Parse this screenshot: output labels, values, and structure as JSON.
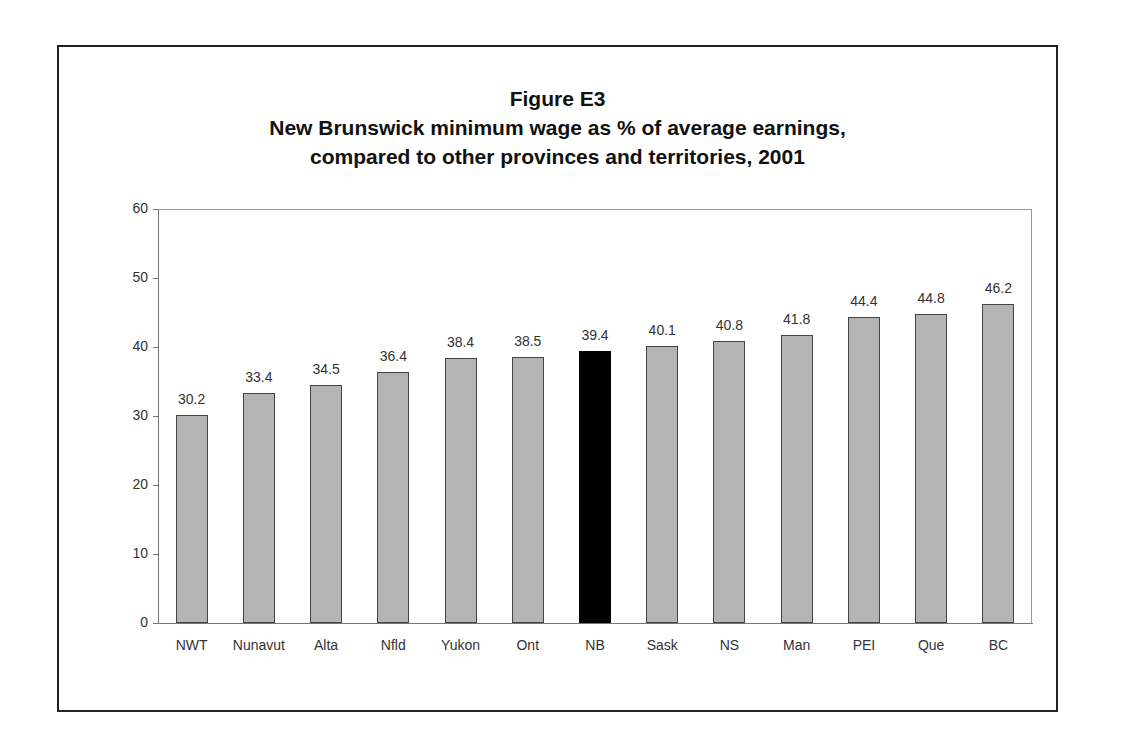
{
  "figure": {
    "label": "Figure E3",
    "title_line1": "New Brunswick minimum wage as % of average earnings,",
    "title_line2": "compared to other provinces and territories, 2001"
  },
  "colors": {
    "bar": "#b4b4b4",
    "highlight_bar": "#000000",
    "frame": "#222222"
  },
  "chart_data": {
    "type": "bar",
    "xlabel": "",
    "ylabel": "",
    "ylim": [
      0,
      60
    ],
    "yticks": [
      0,
      10,
      20,
      30,
      40,
      50,
      60
    ],
    "grid": false,
    "legend": null,
    "highlight": "NB",
    "categories": [
      "NWT",
      "Nunavut",
      "Alta",
      "Nfld",
      "Yukon",
      "Ont",
      "NB",
      "Sask",
      "NS",
      "Man",
      "PEI",
      "Que",
      "BC"
    ],
    "values": [
      30.2,
      33.4,
      34.5,
      36.4,
      38.4,
      38.5,
      39.4,
      40.1,
      40.8,
      41.8,
      44.4,
      44.8,
      46.2
    ],
    "value_labels": [
      "30.2",
      "33.4",
      "34.5",
      "36.4",
      "38.4",
      "38.5",
      "39.4",
      "40.1",
      "40.8",
      "41.8",
      "44.4",
      "44.8",
      "46.2"
    ]
  }
}
